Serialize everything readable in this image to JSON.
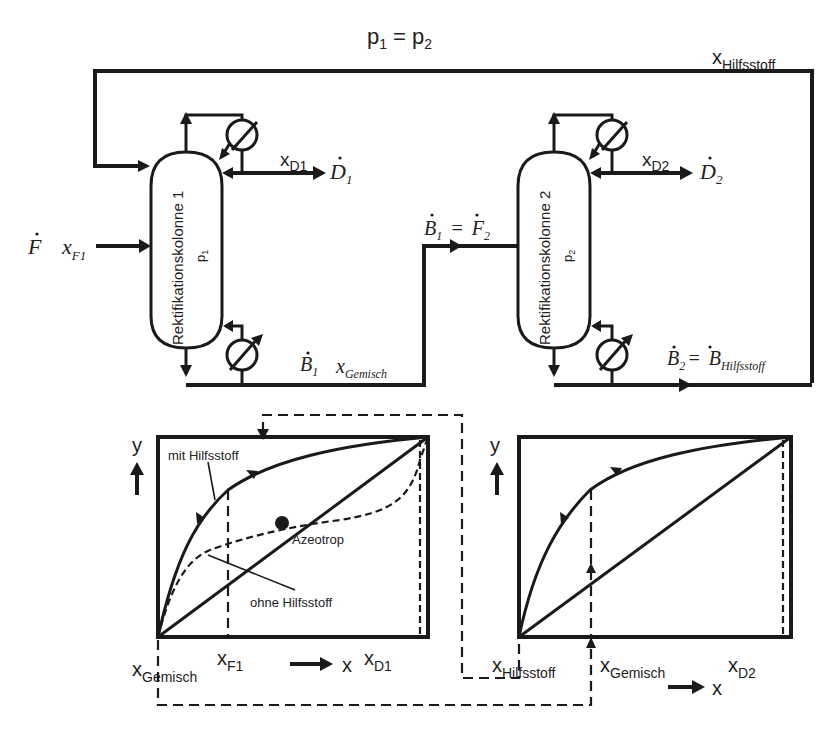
{
  "title": {
    "p1": "p",
    "p1_sub": "1",
    "eq": "=",
    "p2": "p",
    "p2_sub": "2"
  },
  "stream_labels": {
    "x_hilfsstoff_top": {
      "main": "x",
      "sub": "Hilfsstoff"
    },
    "x_d1": {
      "main": "x",
      "sub": "D1"
    },
    "d1": {
      "main": "D",
      "sub": "1"
    },
    "x_d2": {
      "main": "x",
      "sub": "D2"
    },
    "d2": {
      "main": "D",
      "sub": "2"
    },
    "feed_f": {
      "main": "F"
    },
    "x_f1": {
      "main": "x",
      "sub": "F1"
    },
    "b1_f2": {
      "b": "B",
      "b_sub": "1",
      "eq": "=",
      "f": "F",
      "f_sub": "2"
    },
    "b1": {
      "main": "B",
      "sub": "1"
    },
    "x_gemisch_stream": {
      "main": "x",
      "sub": "Gemisch"
    },
    "b2_bh": {
      "b": "B",
      "b_sub": "2",
      "eq": "=",
      "bh": "B",
      "bh_sub": "Hilfsstoff"
    }
  },
  "columns": [
    {
      "name": "Rektifikationskolonne 1",
      "pressure": "p",
      "pressure_sub": "1"
    },
    {
      "name": "Rektifikationskolonne 2",
      "pressure": "p",
      "pressure_sub": "2"
    }
  ],
  "diagram_left": {
    "y_axis": "y",
    "x_axis": "x",
    "label_mit": "mit Hilfsstoff",
    "label_ohne": "ohne Hilfsstoff",
    "label_azeotrop": "Azeotrop",
    "tick_gemisch": {
      "main": "x",
      "sub": "Gemisch"
    },
    "tick_f1": {
      "main": "x",
      "sub": "F1"
    },
    "tick_d1": {
      "main": "x",
      "sub": "D1"
    }
  },
  "diagram_right": {
    "y_axis": "y",
    "x_axis": "x",
    "tick_hilfsstoff": {
      "main": "x",
      "sub": "Hilfsstoff"
    },
    "tick_gemisch": {
      "main": "x",
      "sub": "Gemisch"
    },
    "tick_d2": {
      "main": "x",
      "sub": "D2"
    }
  },
  "colors": {
    "line": "#1a1a1a",
    "background": "#ffffff"
  }
}
